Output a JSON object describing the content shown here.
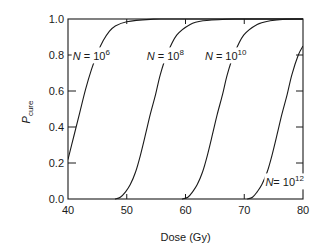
{
  "chart_data": {
    "type": "line",
    "title": "",
    "xlabel": "Dose (Gy)",
    "ylabel": "P",
    "ylabel_subscript": "cure",
    "xlim": [
      40,
      80
    ],
    "ylim": [
      0.0,
      1.0
    ],
    "grid": false,
    "legend": "inline labels",
    "x_ticks": [
      40,
      50,
      60,
      70,
      80
    ],
    "x_tick_labels": [
      "40",
      "50",
      "60",
      "70",
      "80"
    ],
    "y_ticks": [
      0.0,
      0.2,
      0.4,
      0.6,
      0.8,
      1.0
    ],
    "y_tick_labels": [
      "0.0",
      "0.2",
      "0.4",
      "0.6",
      "0.8",
      "1.0"
    ],
    "series": [
      {
        "name": "N = 10^6",
        "label_base": "N",
        "label_eq": " = 10",
        "label_exp": "6",
        "label_pos": [
          40.8,
          0.77
        ],
        "points": [
          [
            40,
            0.22
          ],
          [
            41,
            0.35
          ],
          [
            42,
            0.48
          ],
          [
            43,
            0.61
          ],
          [
            44,
            0.72
          ],
          [
            45,
            0.81
          ],
          [
            46,
            0.88
          ],
          [
            47,
            0.93
          ],
          [
            48,
            0.96
          ],
          [
            50,
            0.985
          ],
          [
            54,
            0.998
          ],
          [
            58,
            1.0
          ],
          [
            80,
            1.0
          ]
        ]
      },
      {
        "name": "N = 10^8",
        "label_base": "N",
        "label_eq": " = 10",
        "label_exp": "8",
        "label_pos": [
          53.4,
          0.77
        ],
        "points": [
          [
            48.0,
            0.0
          ],
          [
            48.9,
            0.01
          ],
          [
            49.8,
            0.04
          ],
          [
            50.6,
            0.08
          ],
          [
            51.5,
            0.15
          ],
          [
            52.3,
            0.24
          ],
          [
            53.2,
            0.36
          ],
          [
            54.0,
            0.47
          ],
          [
            54.9,
            0.58
          ],
          [
            55.7,
            0.69
          ],
          [
            56.8,
            0.8
          ],
          [
            58.5,
            0.91
          ],
          [
            60.8,
            0.97
          ],
          [
            63,
            0.99
          ],
          [
            67,
            0.999
          ],
          [
            70,
            1.0
          ],
          [
            80,
            1.0
          ]
        ]
      },
      {
        "name": "N = 10^10",
        "label_base": "N",
        "label_eq": " = 10",
        "label_exp": "10",
        "label_pos": [
          63.3,
          0.77
        ],
        "points": [
          [
            59.4,
            0.0
          ],
          [
            60.4,
            0.01
          ],
          [
            61.2,
            0.04
          ],
          [
            62.0,
            0.08
          ],
          [
            62.9,
            0.15
          ],
          [
            63.7,
            0.24
          ],
          [
            64.6,
            0.36
          ],
          [
            65.4,
            0.47
          ],
          [
            66.3,
            0.58
          ],
          [
            67.1,
            0.69
          ],
          [
            68.2,
            0.8
          ],
          [
            69.9,
            0.91
          ],
          [
            72.2,
            0.97
          ],
          [
            74.4,
            0.99
          ],
          [
            77,
            0.999
          ],
          [
            80,
            1.0
          ]
        ]
      },
      {
        "name": "N = 10^12",
        "label_base": "N",
        "label_eq": "= 10",
        "label_exp": "12",
        "label_pos": [
          73.6,
          0.07
        ],
        "points": [
          [
            70.5,
            0.0
          ],
          [
            71.4,
            0.01
          ],
          [
            72.2,
            0.04
          ],
          [
            73.0,
            0.08
          ],
          [
            73.9,
            0.15
          ],
          [
            74.7,
            0.24
          ],
          [
            75.6,
            0.36
          ],
          [
            76.4,
            0.47
          ],
          [
            77.3,
            0.58
          ],
          [
            78.1,
            0.69
          ],
          [
            79.2,
            0.8
          ],
          [
            80,
            0.85
          ]
        ]
      }
    ]
  }
}
